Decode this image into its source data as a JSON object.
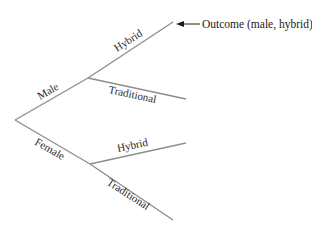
{
  "diagram": {
    "type": "tree",
    "root": {
      "children": [
        {
          "label": "Male",
          "children": [
            {
              "label": "Hybrid"
            },
            {
              "label": "Traditional"
            }
          ]
        },
        {
          "label": "Female",
          "children": [
            {
              "label": "Hybrid"
            },
            {
              "label": "Traditional"
            }
          ]
        }
      ]
    },
    "annotation": {
      "text": "Outcome (male, hybrid)",
      "points_to": "Male > Hybrid"
    },
    "colors": {
      "branch": "#8e8e8e",
      "text": "#2a2a2a"
    }
  }
}
